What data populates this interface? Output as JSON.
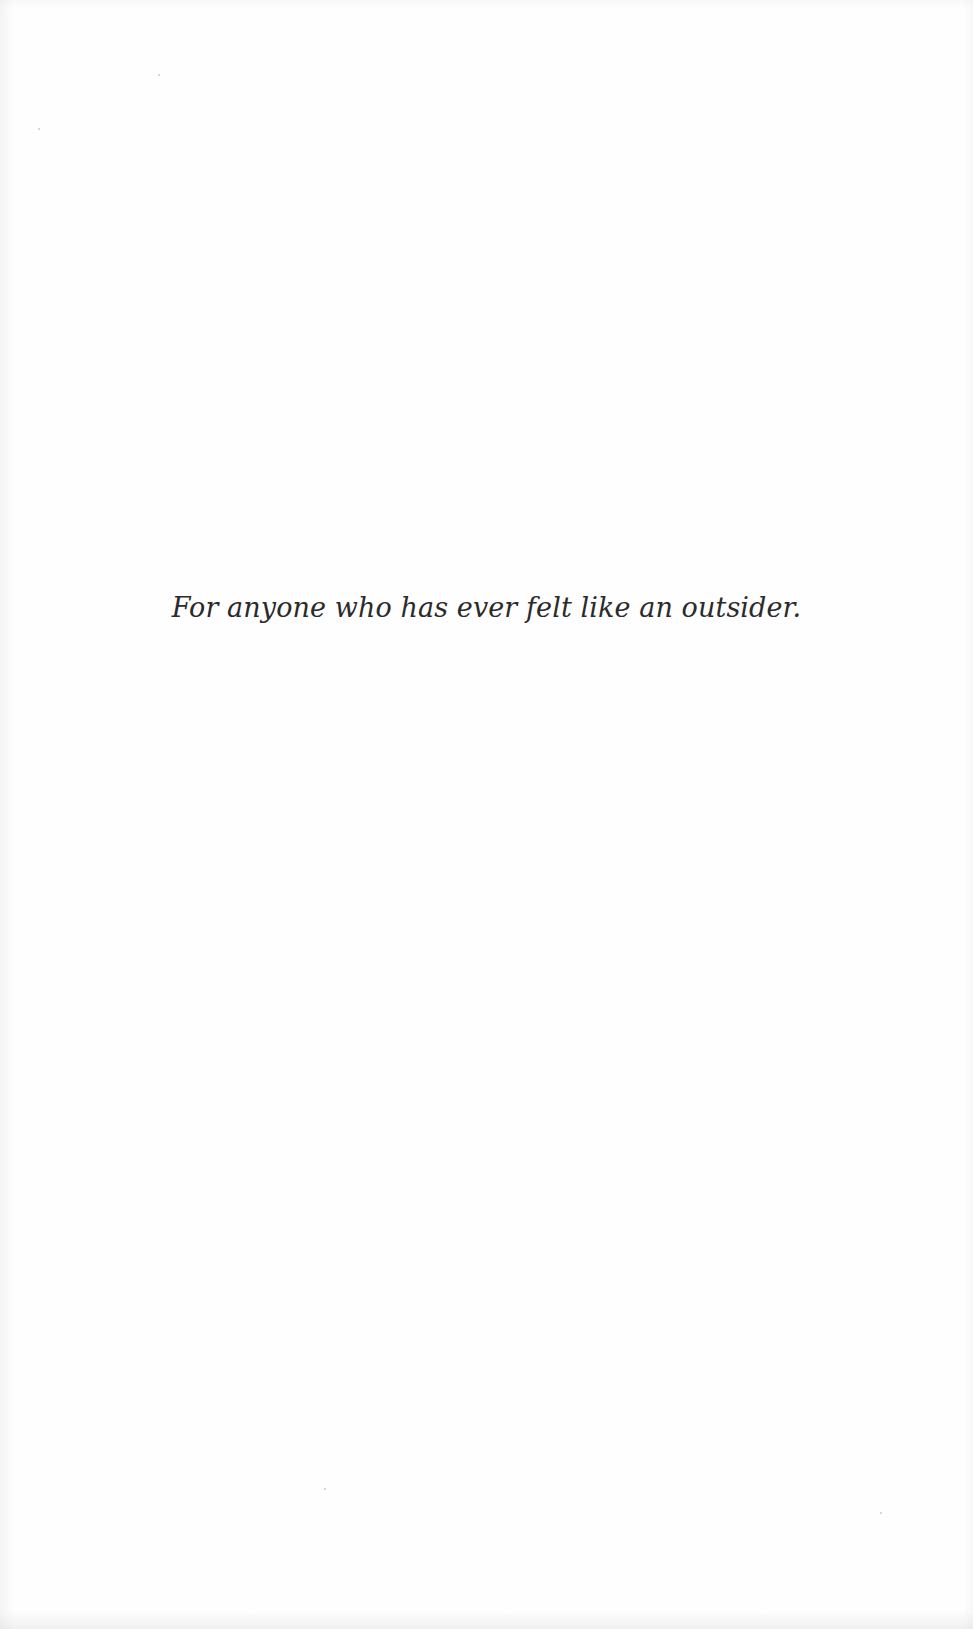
{
  "page": {
    "type": "dedication",
    "dedication_text": "For anyone who has ever felt like an outsider."
  }
}
